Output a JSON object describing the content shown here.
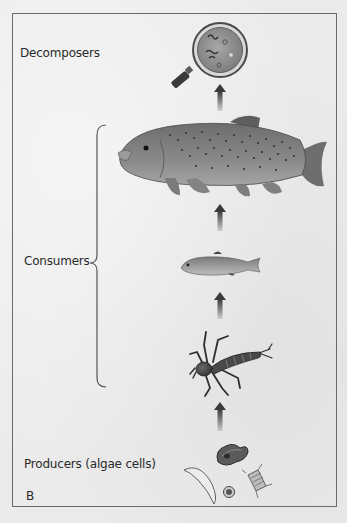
{
  "figure": {
    "panel_label": "B",
    "type": "food chain diagram",
    "levels": [
      {
        "role": "Decomposers",
        "organism": "bacteria under magnifying glass"
      },
      {
        "role": "Consumers",
        "organism": "large trout"
      },
      {
        "role": "Consumers",
        "organism": "small fish"
      },
      {
        "role": "Consumers",
        "organism": "aquatic insect larva"
      },
      {
        "role": "Producers (algae cells)",
        "organism": "algae cells"
      }
    ],
    "labels": {
      "decomposers": "Decomposers",
      "consumers": "Consumers",
      "producers": "Producers (algae cells)",
      "panel": "B"
    },
    "arrow_direction": "up",
    "colors": {
      "frame": "#6a6a6a",
      "text": "#2a2a2a",
      "background": "#ebebeb",
      "arrow": "#4a4a4a"
    }
  }
}
